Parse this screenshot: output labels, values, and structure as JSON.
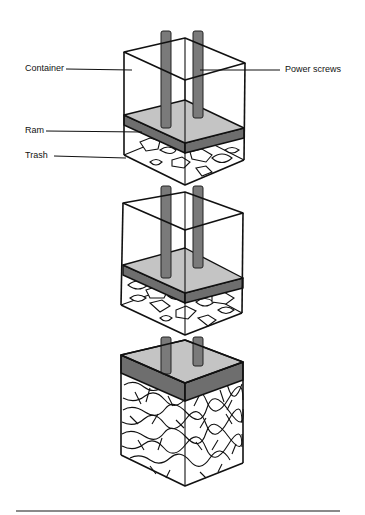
{
  "diagram": {
    "labels": {
      "container": "Container",
      "power_screws": "Power screws",
      "ram": "Ram",
      "trash": "Trash"
    },
    "stages": [
      {
        "name": "stage-1",
        "fill_level": "low",
        "ram_position": "high"
      },
      {
        "name": "stage-2",
        "fill_level": "medium",
        "ram_position": "middle"
      },
      {
        "name": "stage-3",
        "fill_level": "full",
        "ram_position": "top"
      }
    ],
    "colors": {
      "outline": "#111111",
      "ram_top": "#c4c4c4",
      "ram_side": "#6e6e6e",
      "screw": "#7a7a7a",
      "rule": "#8a8a8a"
    }
  }
}
